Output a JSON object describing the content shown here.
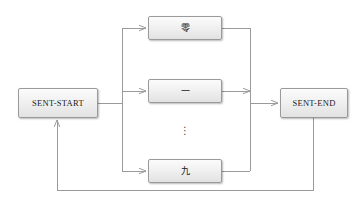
{
  "diagram": {
    "background_color": "#ffffff",
    "line_color": "#9a9a9a",
    "node_border_color": "#9a9a9a",
    "node_fill_top": "#fbfbfb",
    "node_fill_bottom": "#e2e2e2",
    "text_color": "#1a1a1a"
  },
  "nodes": {
    "start": {
      "label": "SENT-START"
    },
    "end": {
      "label": "SENT-END"
    },
    "digit_zero": {
      "label": "零"
    },
    "digit_one": {
      "label": "一"
    },
    "digit_nine": {
      "label": "九"
    }
  },
  "ellipsis": {
    "label": "⋮"
  }
}
